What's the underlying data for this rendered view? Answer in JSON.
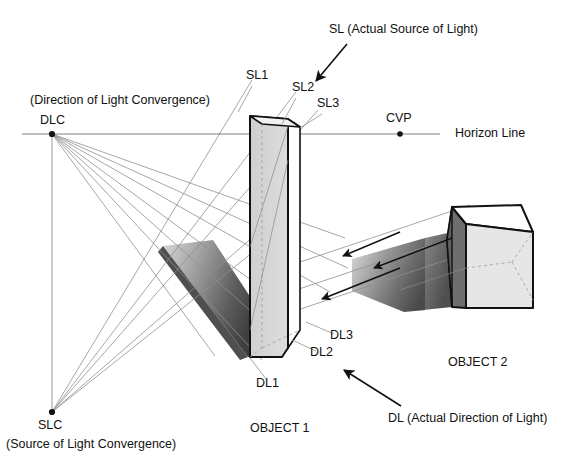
{
  "diagram": {
    "colors": {
      "line": "#111111",
      "construction_line": "#8a8a8a",
      "object_face_light": "#e3e3e3",
      "object_face_mid": "#c9c9c9",
      "object_face_dark": "#6a6a6a",
      "shadow_dark": "#4a4a4a",
      "shadow_light": "#d2d2d2",
      "text": "#111111",
      "background": "#ffffff"
    },
    "labels": {
      "sl_full": "SL (Actual Source of Light)",
      "sl1": "SL1",
      "sl2": "SL2",
      "sl3": "SL3",
      "cvp": "CVP",
      "horizon_line": "Horizon Line",
      "dlc_caption": "(Direction of Light Convergence)",
      "dlc": "DLC",
      "slc": "SLC",
      "slc_caption": "(Source of Light Convergence)",
      "dl1": "DL1",
      "dl2": "DL2",
      "dl3": "DL3",
      "dl_full": "DL (Actual Direction of Light)",
      "object1": "OBJECT 1",
      "object2": "OBJECT 2"
    },
    "points": {
      "dlc": {
        "name": "DLC",
        "x": 52,
        "y": 134
      },
      "cvp": {
        "name": "CVP",
        "x": 400,
        "y": 134
      },
      "slc": {
        "name": "SLC",
        "x": 52,
        "y": 412
      }
    },
    "horizon": {
      "y": 134,
      "x_start": 22,
      "x_end": 400,
      "label_x": 455
    },
    "icons": {
      "sl_arrow": "arrow-down-left-icon",
      "dl_arrow": "arrow-up-left-icon",
      "ray_arrow": "arrow-left-icon",
      "vertex_dot": "point-marker-icon"
    }
  }
}
